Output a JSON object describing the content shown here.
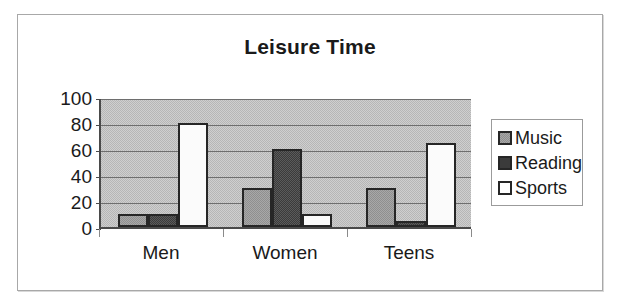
{
  "chart_data": {
    "type": "bar",
    "title": "Leisure Time",
    "xlabel": "",
    "ylabel": "",
    "categories": [
      "Men",
      "Women",
      "Teens"
    ],
    "series": [
      {
        "name": "Music",
        "values": [
          10,
          30,
          30
        ],
        "color": "#8f8f8f"
      },
      {
        "name": "Reading",
        "values": [
          10,
          60,
          5
        ],
        "color": "#3b3b3b"
      },
      {
        "name": "Sports",
        "values": [
          80,
          10,
          65
        ],
        "color": "#ffffff"
      }
    ],
    "ylim": [
      0,
      100
    ],
    "yticks": [
      0,
      20,
      40,
      60,
      80,
      100
    ],
    "ytick_labels": [
      "0",
      "20",
      "40",
      "60",
      "80",
      "100"
    ],
    "grid": true,
    "grid_axis": "y",
    "legend_position": "right",
    "plot_background": "#b6b6b6",
    "frame_background": "#ffffff",
    "border_color": "#a8a8a8"
  },
  "legend": {
    "entries": [
      {
        "label": "Music",
        "swatch": "music-swatch-icon"
      },
      {
        "label": "Reading",
        "swatch": "reading-swatch-icon"
      },
      {
        "label": "Sports",
        "swatch": "sports-swatch-icon"
      }
    ]
  }
}
